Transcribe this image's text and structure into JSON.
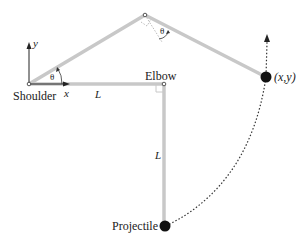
{
  "diagram": {
    "labels": {
      "shoulder": "Shoulder",
      "elbow": "Elbow",
      "projectile": "Projectile",
      "endpoint": "(x,y)",
      "theta_shoulder": "θ",
      "theta_elbow": "θ",
      "length_upper": "L",
      "length_lower": "L",
      "axis_x": "x",
      "axis_y": "y"
    },
    "colors": {
      "arm": "#c8c8c8",
      "axes": "#222222",
      "mass": "#111111",
      "trajectory": "#333333"
    }
  }
}
